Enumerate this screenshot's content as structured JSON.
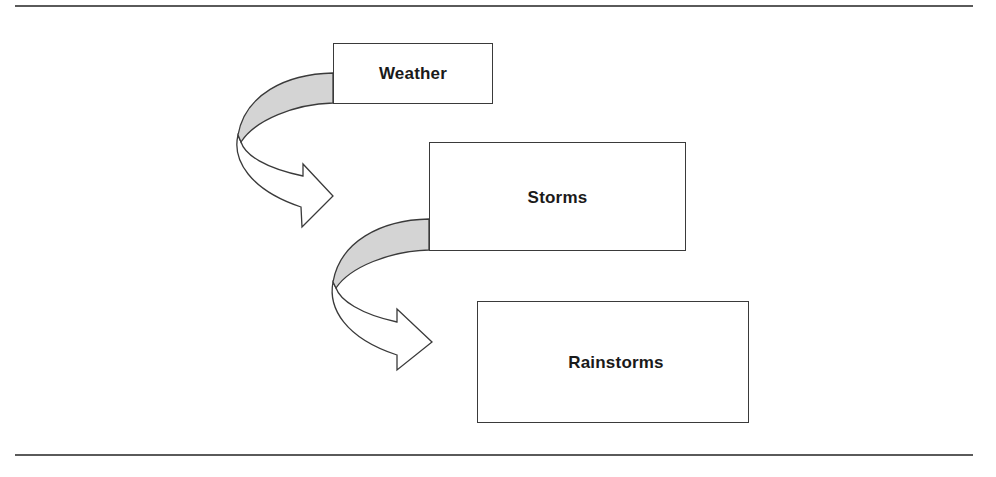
{
  "diagram": {
    "type": "hierarchy-flow",
    "nodes": [
      {
        "id": "weather",
        "label": "Weather",
        "level": 1
      },
      {
        "id": "storms",
        "label": "Storms",
        "level": 2
      },
      {
        "id": "rainstorms",
        "label": "Rainstorms",
        "level": 3
      }
    ],
    "edges": [
      {
        "from": "weather",
        "to": "storms",
        "style": "curved-block-arrow"
      },
      {
        "from": "storms",
        "to": "rainstorms",
        "style": "curved-block-arrow"
      }
    ],
    "colors": {
      "stroke": "#3a3a3a",
      "arrow_shade": "#d4d4d4",
      "arrow_fill": "#ffffff",
      "rule": "#5a5a5a",
      "text": "#1a1a1a"
    }
  }
}
